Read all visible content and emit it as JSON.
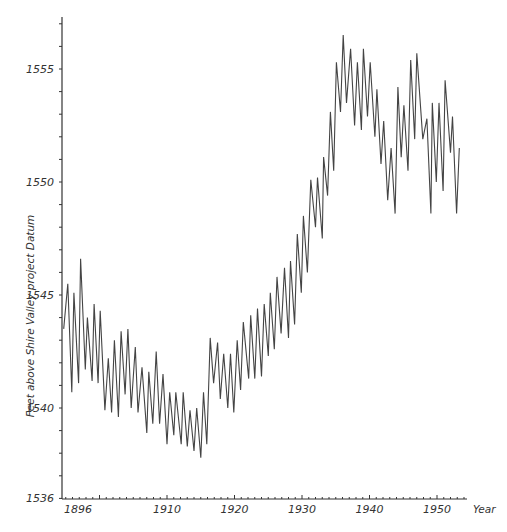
{
  "chart_data": {
    "type": "line",
    "title": "",
    "xlabel": "Year",
    "ylabel": "Feet above Shire Valley project Datum",
    "xlim": [
      1894.4,
      1954.4
    ],
    "ylim": [
      1536,
      1557.2
    ],
    "grid": false,
    "legend": null,
    "x_tick_labels": [
      "1896",
      "1910",
      "1920",
      "1930",
      "1940",
      "1950"
    ],
    "x_tick_positions": [
      1896,
      1910,
      1920,
      1930,
      1940,
      1950
    ],
    "y_tick_labels": [
      "1536",
      "1540",
      "1545",
      "1550",
      "1555"
    ],
    "y_tick_positions": [
      1536,
      1540,
      1545,
      1550,
      1555
    ],
    "series": [
      {
        "name": "Lake level",
        "color": "#444444",
        "points": [
          [
            1894.7,
            1543.5
          ],
          [
            1895.3,
            1545.5
          ],
          [
            1895.9,
            1540.7
          ],
          [
            1896.2,
            1545.1
          ],
          [
            1896.9,
            1541.1
          ],
          [
            1897.2,
            1546.6
          ],
          [
            1897.9,
            1541.7
          ],
          [
            1898.2,
            1544.0
          ],
          [
            1898.9,
            1541.2
          ],
          [
            1899.2,
            1544.6
          ],
          [
            1899.8,
            1541.1
          ],
          [
            1900.1,
            1544.3
          ],
          [
            1900.8,
            1539.9
          ],
          [
            1901.3,
            1542.2
          ],
          [
            1901.8,
            1539.8
          ],
          [
            1902.2,
            1543.0
          ],
          [
            1902.8,
            1539.6
          ],
          [
            1903.2,
            1543.4
          ],
          [
            1903.8,
            1540.6
          ],
          [
            1904.2,
            1543.5
          ],
          [
            1904.7,
            1540.0
          ],
          [
            1905.3,
            1542.7
          ],
          [
            1905.7,
            1539.8
          ],
          [
            1906.3,
            1541.8
          ],
          [
            1907.0,
            1538.9
          ],
          [
            1907.3,
            1541.6
          ],
          [
            1907.9,
            1539.3
          ],
          [
            1908.4,
            1542.5
          ],
          [
            1908.9,
            1539.3
          ],
          [
            1909.4,
            1541.5
          ],
          [
            1910.0,
            1538.4
          ],
          [
            1910.4,
            1540.7
          ],
          [
            1911.0,
            1538.8
          ],
          [
            1911.3,
            1540.7
          ],
          [
            1912.1,
            1538.4
          ],
          [
            1912.4,
            1540.7
          ],
          [
            1913.0,
            1538.3
          ],
          [
            1913.4,
            1539.9
          ],
          [
            1914.0,
            1538.1
          ],
          [
            1914.4,
            1540.0
          ],
          [
            1915.0,
            1537.8
          ],
          [
            1915.4,
            1540.7
          ],
          [
            1915.9,
            1538.4
          ],
          [
            1916.4,
            1543.1
          ],
          [
            1916.9,
            1541.1
          ],
          [
            1917.5,
            1542.9
          ],
          [
            1917.9,
            1540.4
          ],
          [
            1918.4,
            1542.4
          ],
          [
            1919.0,
            1540.0
          ],
          [
            1919.4,
            1542.4
          ],
          [
            1919.9,
            1539.8
          ],
          [
            1920.4,
            1543.0
          ],
          [
            1920.9,
            1540.8
          ],
          [
            1921.3,
            1543.8
          ],
          [
            1922.1,
            1541.3
          ],
          [
            1922.4,
            1544.1
          ],
          [
            1923.0,
            1541.3
          ],
          [
            1923.4,
            1544.4
          ],
          [
            1924.0,
            1541.4
          ],
          [
            1924.4,
            1544.6
          ],
          [
            1925.0,
            1542.3
          ],
          [
            1925.3,
            1545.1
          ],
          [
            1925.9,
            1542.6
          ],
          [
            1926.3,
            1545.8
          ],
          [
            1926.9,
            1543.3
          ],
          [
            1927.4,
            1546.2
          ],
          [
            1928.0,
            1543.1
          ],
          [
            1928.3,
            1546.5
          ],
          [
            1928.9,
            1543.7
          ],
          [
            1929.3,
            1547.7
          ],
          [
            1929.9,
            1545.1
          ],
          [
            1930.2,
            1548.5
          ],
          [
            1930.8,
            1546.0
          ],
          [
            1931.3,
            1550.1
          ],
          [
            1932.0,
            1548.0
          ],
          [
            1932.3,
            1550.2
          ],
          [
            1933.0,
            1547.5
          ],
          [
            1933.2,
            1551.1
          ],
          [
            1933.8,
            1549.4
          ],
          [
            1934.2,
            1553.1
          ],
          [
            1934.7,
            1550.5
          ],
          [
            1935.1,
            1555.3
          ],
          [
            1935.7,
            1553.1
          ],
          [
            1936.1,
            1556.5
          ],
          [
            1936.6,
            1553.5
          ],
          [
            1937.2,
            1555.9
          ],
          [
            1937.8,
            1552.5
          ],
          [
            1938.2,
            1555.3
          ],
          [
            1938.8,
            1552.3
          ],
          [
            1939.1,
            1555.9
          ],
          [
            1939.7,
            1552.9
          ],
          [
            1940.1,
            1555.3
          ],
          [
            1940.8,
            1552.0
          ],
          [
            1941.1,
            1554.1
          ],
          [
            1941.7,
            1550.8
          ],
          [
            1942.1,
            1552.7
          ],
          [
            1942.7,
            1549.2
          ],
          [
            1943.2,
            1551.5
          ],
          [
            1943.8,
            1548.6
          ],
          [
            1944.2,
            1554.2
          ],
          [
            1944.7,
            1551.1
          ],
          [
            1945.1,
            1553.4
          ],
          [
            1945.7,
            1550.5
          ],
          [
            1946.1,
            1555.4
          ],
          [
            1946.7,
            1551.9
          ],
          [
            1947.0,
            1555.7
          ],
          [
            1947.9,
            1551.9
          ],
          [
            1948.5,
            1552.8
          ],
          [
            1949.1,
            1548.6
          ],
          [
            1949.3,
            1553.5
          ],
          [
            1949.9,
            1550.0
          ],
          [
            1950.3,
            1553.5
          ],
          [
            1950.9,
            1549.6
          ],
          [
            1951.2,
            1554.5
          ],
          [
            1952.0,
            1551.3
          ],
          [
            1952.3,
            1552.9
          ],
          [
            1952.9,
            1548.6
          ],
          [
            1953.3,
            1551.5
          ]
        ]
      }
    ]
  }
}
